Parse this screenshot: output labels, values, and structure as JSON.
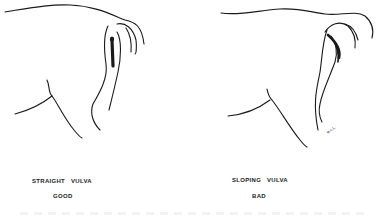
{
  "figures": [
    {
      "id": "left",
      "caption_line1": "STRAIGHT   VULVA",
      "caption_line2": "GOOD",
      "description": "Hindquarters of a cow with a vertically oriented vulva"
    },
    {
      "id": "right",
      "caption_line1": "SLOPING   VULVA",
      "caption_line2": "BAD",
      "description": "Hindquarters of a cow with a sloping (tilted) vulva",
      "signature": "w.c.L."
    }
  ],
  "colors": {
    "ink": "#1a1a1a",
    "background": "#ffffff"
  }
}
